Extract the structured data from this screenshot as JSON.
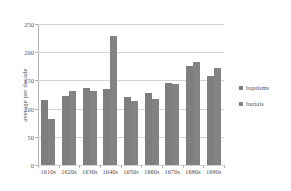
{
  "chart_data": {
    "type": "bar",
    "title": "",
    "xlabel": "",
    "ylabel": "average per decade",
    "ylim": [
      0,
      250
    ],
    "yticks": [
      0,
      50,
      100,
      150,
      200,
      250
    ],
    "grid": true,
    "legend_position": "right",
    "categories": [
      "1610s",
      "1620s",
      "1630s",
      "1640s",
      "1650s",
      "1660s",
      "1670s",
      "1680s",
      "1690s"
    ],
    "series": [
      {
        "name": "baptisms",
        "color": "#7e7e7e",
        "values": [
          115,
          122,
          136,
          135,
          120,
          127,
          145,
          176,
          157
        ]
      },
      {
        "name": "burials",
        "color": "#838383",
        "values": [
          82,
          131,
          131,
          228,
          114,
          117,
          143,
          182,
          172
        ]
      }
    ]
  },
  "colors": {
    "bar_primary": "#7e7e7e",
    "bar_secondary": "#838383",
    "gridline": "#d4d4d4",
    "axis": "#b3b3b3",
    "text": "#4d4d4d",
    "background": "#ffffff"
  }
}
